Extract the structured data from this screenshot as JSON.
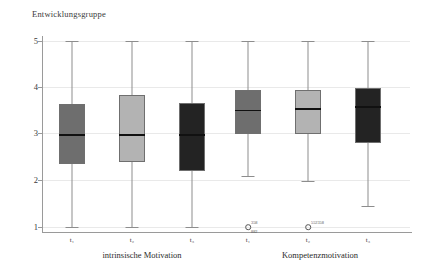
{
  "chart_data": {
    "type": "boxplot",
    "title": "Entwicklungsgruppe",
    "xlabel": "",
    "ylabel": "",
    "ylim": [
      1,
      5
    ],
    "yticks": [
      "5",
      "4",
      "3",
      "2",
      "1"
    ],
    "grid": true,
    "legend": "none",
    "groups": [
      {
        "label": "intrinsische Motivation",
        "times": [
          "t₁",
          "t₂",
          "t₃"
        ]
      },
      {
        "label": "Kompetenzmotivation",
        "times": [
          "t₁",
          "t₂",
          "t₃"
        ]
      }
    ],
    "boxes": [
      {
        "name": "intrinsische Motivation t1",
        "time": "t₁",
        "group": "intrinsische Motivation",
        "whisker_low": 1.0,
        "q1": 2.35,
        "median": 3.0,
        "q3": 3.65,
        "whisker_high": 5.0,
        "color": "#6e6e6e",
        "outliers": []
      },
      {
        "name": "intrinsische Motivation t2",
        "time": "t₂",
        "group": "intrinsische Motivation",
        "whisker_low": 1.0,
        "q1": 2.4,
        "median": 3.0,
        "q3": 3.83,
        "whisker_high": 5.0,
        "color": "#b3b3b3",
        "outliers": []
      },
      {
        "name": "intrinsische Motivation t3",
        "time": "t₃",
        "group": "intrinsische Motivation",
        "whisker_low": 1.0,
        "q1": 2.2,
        "median": 3.0,
        "q3": 3.67,
        "whisker_high": 5.0,
        "color": "#232323",
        "outliers": []
      },
      {
        "name": "Kompetenzmotivation t1",
        "time": "t₁",
        "group": "Kompetenzmotivation",
        "whisker_low": 2.1,
        "q1": 3.0,
        "median": 3.52,
        "q3": 3.95,
        "whisker_high": 5.0,
        "color": "#6e6e6e",
        "outliers": [
          {
            "value": 1.0,
            "labels": [
              "358",
              "882"
            ]
          }
        ]
      },
      {
        "name": "Kompetenzmotivation t2",
        "time": "t₂",
        "group": "Kompetenzmotivation",
        "whisker_low": 2.0,
        "q1": 3.0,
        "median": 3.55,
        "q3": 3.95,
        "whisker_high": 5.0,
        "color": "#b3b3b3",
        "outliers": [
          {
            "value": 1.0,
            "labels": [
              "552358"
            ]
          }
        ]
      },
      {
        "name": "Kompetenzmotivation t3",
        "time": "t₃",
        "group": "Kompetenzmotivation",
        "whisker_low": 1.45,
        "q1": 2.8,
        "median": 3.6,
        "q3": 4.0,
        "whisker_high": 5.0,
        "color": "#232323",
        "outliers": []
      }
    ]
  },
  "title": {
    "text": "Entwicklungsgruppe"
  },
  "axis": {
    "y": {
      "t5": "5",
      "t4": "4",
      "t3": "3",
      "t2": "2",
      "t1": "1"
    }
  },
  "categories": {
    "b0": "t₁",
    "b1": "t₂",
    "b2": "t₃",
    "b3": "t₁",
    "b4": "t₂",
    "b5": "t₃"
  },
  "groups": {
    "left": "intrinsische Motivation",
    "right": "Kompetenzmotivation"
  },
  "outlier_labels": {
    "b3_top": "358",
    "b3_bottom": "882",
    "b4_top": "552358"
  }
}
